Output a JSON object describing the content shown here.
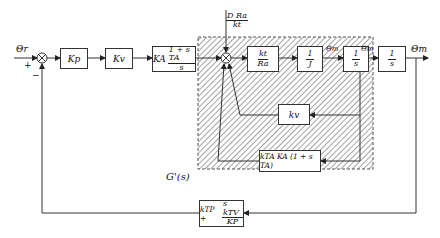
{
  "diagram": {
    "input_label": "Θr",
    "output_label": "Θm",
    "sum1_signs": {
      "plus": "+",
      "minus": "−"
    },
    "blocks": {
      "kp": "Kp",
      "kv": "Kv",
      "ka": {
        "gain": "KA",
        "num": "1 + s TA",
        "den": "s"
      },
      "kt_ra": {
        "num": "kt",
        "den": "Ra"
      },
      "inv_j": {
        "num": "1",
        "den": "J"
      },
      "integrator1": {
        "num": "1",
        "den": "s"
      },
      "integrator2": {
        "num": "1",
        "den": "s"
      },
      "kv_feedback": "kv",
      "tacho_feedback": "kTA KA (1 + s TA)",
      "position_feedback": {
        "lead": "kTP +",
        "num": "s kTV",
        "den": "KP"
      }
    },
    "disturbance": {
      "num": "D Ra",
      "den": "kt"
    },
    "signals": {
      "accel": "Θ̈m",
      "velocity": "Θ̇m"
    },
    "inner_loop_label": "G'(s)",
    "colors": {
      "line": "#333333",
      "hatch": "#555555",
      "box_fill": "#ffffff"
    }
  }
}
